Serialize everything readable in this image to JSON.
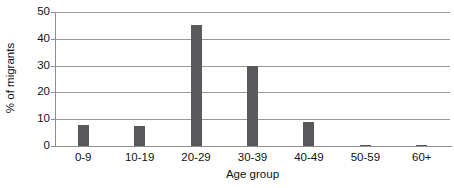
{
  "chart_data": {
    "type": "bar",
    "title": "",
    "xlabel": "Age group",
    "ylabel": "% of migrants",
    "categories": [
      "0-9",
      "10-19",
      "20-29",
      "30-39",
      "40-49",
      "50-59",
      "60+"
    ],
    "values": [
      8,
      7.5,
      45,
      30,
      9,
      0.5,
      0.3
    ],
    "ylim": [
      0,
      50
    ],
    "yticks": [
      0,
      10,
      20,
      30,
      40,
      50
    ],
    "ytick_labels": [
      "0",
      "10",
      "20",
      "30",
      "40",
      "50"
    ],
    "grid": true,
    "legend": "none",
    "series": [
      {
        "name": "% of migrants",
        "values": [
          8,
          7.5,
          45,
          30,
          9,
          0.5,
          0.3
        ]
      }
    ],
    "colors": {
      "bar": "#59595b",
      "gridline": "#9a9a9a",
      "axis": "#8f8f8f",
      "text": "#111111",
      "background": "#ffffff"
    }
  }
}
